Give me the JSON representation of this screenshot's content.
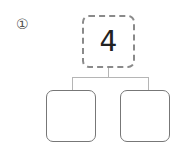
{
  "problem": {
    "number_label": "①",
    "top_value": "4",
    "children": [
      "",
      ""
    ]
  },
  "colors": {
    "top_border": "#8a8a8a",
    "child_border": "#777777",
    "connector": "#b5b5b5"
  }
}
